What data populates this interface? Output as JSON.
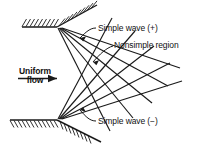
{
  "figure": {
    "background_color": "#ffffff",
    "line_color": "#1a1a1a",
    "width": 205,
    "height": 146
  },
  "labels": {
    "simple_wave_plus": "Simple wave (+)",
    "nonsimple_region": "Nonsimple region",
    "simple_wave_minus": "Simple wave (−)",
    "uniform_flow_line1": "Uniform",
    "uniform_flow_line2": "flow"
  },
  "geometry": {
    "upper_wall": {
      "corner_x": 57,
      "corner_y": 27,
      "left_x": 22,
      "right_x": 96,
      "right_y": 6,
      "hatch_side": "above"
    },
    "lower_wall": {
      "corner_x": 57,
      "corner_y": 120,
      "left_x": 10,
      "right_x": 100,
      "right_y": 142,
      "hatch_side": "below"
    },
    "upper_fan_rays": 5,
    "lower_fan_rays": 5,
    "flow_arrow": {
      "x1": 18,
      "y1": 78,
      "x2": 60,
      "y2": 78,
      "direction": "right"
    }
  }
}
